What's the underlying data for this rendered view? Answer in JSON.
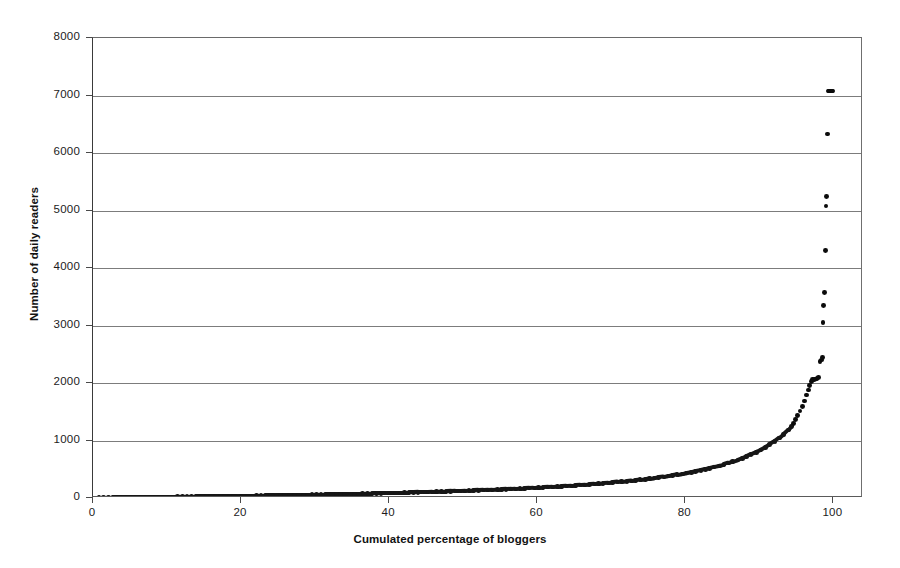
{
  "figure": {
    "background_color": "#ffffff",
    "marker_color": "#161616",
    "gridline_color": "#7c7c7c",
    "axis_color": "#4a4a4a"
  },
  "chart_data": {
    "type": "scatter",
    "title": "",
    "subtitle": "",
    "xlabel": "Cumulated percentage of bloggers",
    "ylabel": "Number of daily readers",
    "xlim": [
      0,
      104
    ],
    "ylim": [
      0,
      8000
    ],
    "grid": true,
    "grid_axis": "y",
    "legend": false,
    "legend_position": "none",
    "xticks": [
      0,
      20,
      40,
      60,
      80,
      100
    ],
    "xticklabels": [
      "0",
      "20",
      "40",
      "60",
      "80",
      "100"
    ],
    "yticks": [
      0,
      1000,
      2000,
      3000,
      4000,
      5000,
      6000,
      7000,
      8000
    ],
    "yticklabels": [
      "0",
      "1000",
      "2000",
      "3000",
      "4000",
      "5000",
      "6000",
      "7000",
      "8000"
    ],
    "annotations": [],
    "series": [
      {
        "name": "Daily readers per blogger (sorted ascending)",
        "marker": "diamond",
        "color": "#161616",
        "x": [
          0.2,
          0.8,
          1.4,
          2.1,
          2.7,
          3.3,
          3.9,
          4.6,
          5.2,
          5.8,
          6.4,
          7.1,
          7.7,
          8.3,
          8.9,
          9.6,
          10.2,
          10.8,
          11.4,
          12.1,
          12.7,
          13.3,
          13.9,
          14.6,
          15.2,
          15.8,
          16.4,
          17.1,
          17.7,
          18.3,
          18.9,
          19.6,
          20.2,
          20.8,
          21.4,
          22.1,
          22.7,
          23.3,
          23.9,
          24.6,
          25.2,
          25.8,
          26.4,
          27.1,
          27.7,
          28.3,
          28.9,
          29.6,
          30.2,
          30.8,
          31.4,
          32.1,
          32.7,
          33.3,
          33.9,
          34.6,
          35.2,
          35.8,
          36.4,
          37.1,
          37.7,
          38.3,
          38.9,
          39.6,
          40.2,
          40.8,
          41.4,
          42.1,
          42.7,
          43.3,
          43.9,
          44.6,
          45.2,
          45.8,
          46.4,
          47.1,
          47.7,
          48.3,
          48.9,
          49.6,
          50.2,
          50.8,
          51.4,
          52.1,
          52.7,
          53.3,
          53.9,
          54.6,
          55.2,
          55.8,
          56.4,
          57.1,
          57.7,
          58.3,
          58.9,
          59.6,
          60.2,
          60.8,
          61.4,
          62.1,
          62.7,
          63.3,
          63.9,
          64.6,
          65.2,
          65.8,
          66.4,
          67.1,
          67.7,
          68.3,
          68.9,
          69.6,
          70.2,
          70.8,
          71.4,
          72.1,
          72.7,
          73.3,
          73.9,
          74.6,
          75.2,
          75.8,
          76.4,
          77.1,
          77.7,
          78.3,
          78.9,
          79.6,
          80.2,
          80.8,
          81.4,
          82.1,
          82.7,
          83.3,
          83.9,
          84.6,
          85.2,
          85.8,
          86.4,
          87.1,
          87.7,
          88.3,
          88.9,
          89.6,
          90.2,
          90.8,
          91.4,
          92.1,
          92.7,
          93.3,
          93.9,
          94.3,
          94.6,
          94.9,
          95.2,
          95.5,
          95.8,
          96.1,
          96.4,
          96.6,
          96.8,
          97.0,
          97.2,
          97.4,
          97.6,
          97.8,
          98.0,
          98.2,
          98.35,
          98.5,
          98.6,
          98.7,
          98.8,
          98.9,
          99.0,
          99.1,
          99.2,
          99.3,
          99.4,
          99.5,
          99.6,
          99.7,
          99.8,
          99.9
        ],
        "y": [
          3,
          4,
          5,
          6,
          7,
          8,
          9,
          10,
          11,
          12,
          13,
          14,
          15,
          16,
          17,
          18,
          19,
          20,
          21,
          22,
          23,
          24,
          25,
          26,
          27,
          28,
          29,
          30,
          31,
          32,
          34,
          35,
          36,
          37,
          38,
          40,
          41,
          42,
          43,
          45,
          46,
          47,
          49,
          50,
          52,
          53,
          55,
          56,
          58,
          59,
          61,
          62,
          64,
          66,
          67,
          69,
          71,
          72,
          74,
          76,
          78,
          80,
          82,
          84,
          86,
          88,
          90,
          92,
          94,
          96,
          99,
          101,
          103,
          106,
          108,
          111,
          113,
          116,
          119,
          121,
          124,
          127,
          130,
          133,
          136,
          139,
          142,
          146,
          149,
          152,
          156,
          160,
          163,
          167,
          171,
          175,
          179,
          184,
          188,
          193,
          197,
          202,
          207,
          212,
          218,
          223,
          229,
          235,
          241,
          247,
          254,
          261,
          268,
          275,
          283,
          291,
          299,
          308,
          317,
          326,
          336,
          346,
          357,
          368,
          380,
          392,
          405,
          419,
          433,
          448,
          464,
          481,
          499,
          518,
          538,
          559,
          582,
          606,
          632,
          660,
          690,
          722,
          757,
          795,
          836,
          881,
          930,
          984,
          1043,
          1108,
          1180,
          1240,
          1300,
          1365,
          1435,
          1512,
          1596,
          1688,
          1790,
          1880,
          1960,
          2030,
          2060,
          2065,
          2070,
          2080,
          2090,
          2380,
          2400,
          2450,
          3050,
          3350,
          3570,
          4300,
          5080,
          5250,
          6330,
          7080,
          7080,
          7080,
          7080,
          7080,
          7080,
          7080
        ],
        "notable_outliers": [
          {
            "x": 99.3,
            "y": 7080
          },
          {
            "x": 99.2,
            "y": 6330
          },
          {
            "x": 99.1,
            "y": 5250
          },
          {
            "x": 99.0,
            "y": 5080
          },
          {
            "x": 98.9,
            "y": 4300
          },
          {
            "x": 98.8,
            "y": 3570
          },
          {
            "x": 98.7,
            "y": 3350
          },
          {
            "x": 98.6,
            "y": 3050
          },
          {
            "x": 98.5,
            "y": 2450
          },
          {
            "x": 98.35,
            "y": 2400
          },
          {
            "x": 98.2,
            "y": 2380
          },
          {
            "x": 98.0,
            "y": 2090
          }
        ]
      }
    ]
  }
}
